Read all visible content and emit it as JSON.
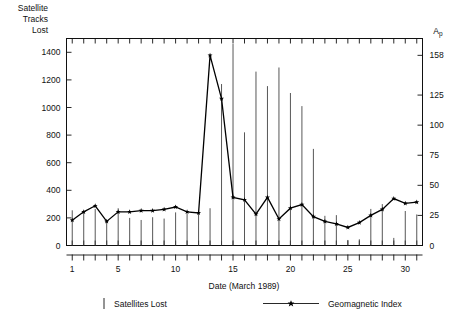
{
  "figure": {
    "left_axis_title_lines": [
      "Satellite",
      "Tracks",
      "Lost"
    ],
    "right_axis_title": "Ap",
    "right_axis_title_main": "A",
    "right_axis_title_sub": "p",
    "xlabel": "Date (March 1989)"
  },
  "legend": {
    "items": [
      {
        "label": "Satellites Lost",
        "marker": "vertical-bar-icon"
      },
      {
        "label": "Geomagnetic Index",
        "marker": "line-star-icon"
      }
    ]
  },
  "chart_data": {
    "type": "bar",
    "title": "",
    "subtitle": "",
    "xlabel": "Date (March 1989)",
    "ylabel": "Satellite Tracks Lost",
    "y2label": "Ap",
    "xlim": [
      0.5,
      31.5
    ],
    "ylim": [
      0,
      1500
    ],
    "y2lim": [
      0,
      172
    ],
    "grid": false,
    "legend_position": "below-axes",
    "xticks": [
      1,
      2,
      3,
      4,
      5,
      6,
      7,
      8,
      9,
      10,
      11,
      12,
      13,
      14,
      15,
      16,
      17,
      18,
      19,
      20,
      21,
      22,
      23,
      24,
      25,
      26,
      27,
      28,
      29,
      30,
      31
    ],
    "xticklabels": [
      "1",
      "",
      "",
      "",
      "5",
      "",
      "",
      "",
      "",
      "10",
      "",
      "",
      "",
      "",
      "15",
      "",
      "",
      "",
      "",
      "20",
      "",
      "",
      "",
      "",
      "25",
      "",
      "",
      "",
      "",
      "30",
      ""
    ],
    "xticklabel_days": [
      1,
      5,
      10,
      15,
      20,
      25,
      30
    ],
    "yticks": [
      0,
      200,
      400,
      600,
      800,
      1000,
      1200,
      1400
    ],
    "yticklabels": [
      "0",
      "200",
      "400",
      "600",
      "800",
      "1000",
      "1200",
      "1400"
    ],
    "y2ticks": [
      0,
      25,
      50,
      75,
      100,
      125,
      158
    ],
    "y2ticklabels": [
      "0",
      "25",
      "50",
      "75",
      "100",
      "125",
      "158"
    ],
    "categories": [
      1,
      2,
      3,
      4,
      5,
      6,
      7,
      8,
      9,
      10,
      11,
      12,
      13,
      14,
      15,
      16,
      17,
      18,
      19,
      20,
      21,
      22,
      23,
      24,
      25,
      26,
      27,
      28,
      29,
      30,
      31
    ],
    "series": [
      {
        "name": "Satellites Lost",
        "type": "bar",
        "axis": "left",
        "units": "satellite tracks lost",
        "values": [
          255,
          250,
          265,
          185,
          270,
          200,
          185,
          205,
          195,
          240,
          230,
          235,
          270,
          1170,
          1460,
          820,
          1260,
          1155,
          1290,
          1105,
          1010,
          700,
          215,
          220,
          40,
          45,
          265,
          300,
          55,
          250,
          225
        ]
      },
      {
        "name": "Geomagnetic Index",
        "type": "line",
        "marker": "star",
        "axis": "right",
        "units": "Ap",
        "values": [
          21,
          28,
          33,
          20,
          28,
          28,
          29,
          29,
          30,
          32,
          28,
          27,
          158,
          122,
          40,
          38,
          26,
          40,
          22,
          31,
          34,
          24,
          20,
          18,
          15,
          19,
          25,
          30,
          39,
          35,
          36
        ]
      }
    ]
  }
}
